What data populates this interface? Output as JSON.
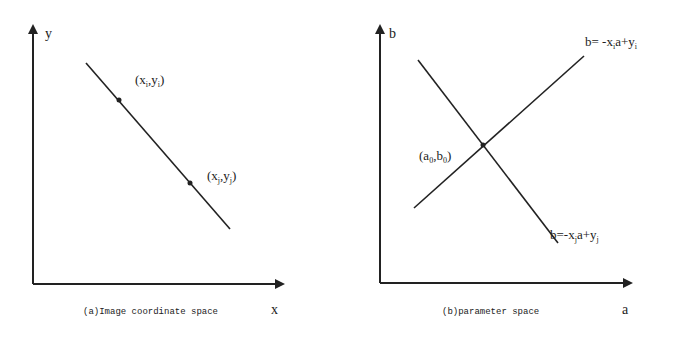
{
  "panels": [
    {
      "id": "a",
      "caption": "(a)Image coordinate space",
      "x_axis_label": "x",
      "y_axis_label": "y",
      "points": [
        {
          "name": "point-i",
          "label_base_x": "x",
          "sub_x": "i",
          "label_base_y": "y",
          "sub_y": "i"
        },
        {
          "name": "point-j",
          "label_base_x": "x",
          "sub_x": "j",
          "label_base_y": "y",
          "sub_y": "j"
        }
      ],
      "lines": [
        {
          "name": "image-line",
          "description": "straight line through (xi,yi) and (xj,yj)"
        }
      ]
    },
    {
      "id": "b",
      "caption": "(b)parameter space",
      "x_axis_label": "a",
      "y_axis_label": "b",
      "intersection": {
        "label_base_a": "a",
        "sub_a": "0",
        "label_base_b": "b",
        "sub_b": "0"
      },
      "lines": [
        {
          "name": "line-i",
          "eq_prefix": "b= -x",
          "sub_x": "i",
          "eq_mid": "a+y",
          "sub_y": "i"
        },
        {
          "name": "line-j",
          "eq_prefix": "b=-x",
          "sub_x": "j",
          "eq_mid": "a+y",
          "sub_y": "j"
        }
      ]
    }
  ],
  "colors": {
    "ink": "#222222",
    "background": "#ffffff"
  }
}
